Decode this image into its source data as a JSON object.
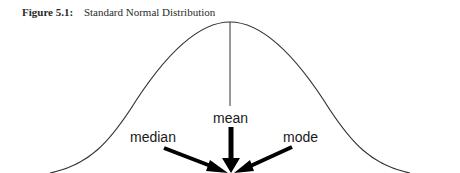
{
  "figure": {
    "number": "Figure 5.1:",
    "title": "Standard Normal Distribution"
  },
  "labels": {
    "mean": "mean",
    "median": "median",
    "mode": "mode"
  },
  "colors": {
    "curve": "#333333",
    "arrow": "#000000",
    "text": "#1a1a1a"
  }
}
